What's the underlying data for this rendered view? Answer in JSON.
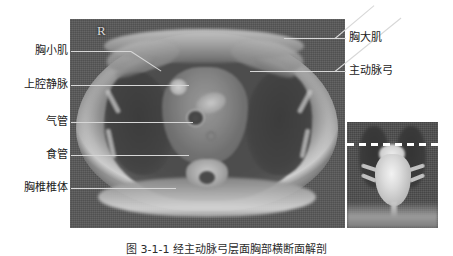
{
  "figure": {
    "orientation_marker": "R",
    "caption": "图 3-1-1  经主动脉弓层面胸部横断面解剖"
  },
  "labels_left": [
    {
      "text": "胸小肌",
      "top": 45,
      "lead_y": 51
    },
    {
      "text": "上腔静脉",
      "top": 79,
      "lead_y": 85
    },
    {
      "text": "气管",
      "top": 116,
      "lead_y": 122
    },
    {
      "text": "食管",
      "top": 149,
      "lead_y": 155
    },
    {
      "text": "胸椎椎体",
      "top": 182,
      "lead_y": 188
    }
  ],
  "labels_right": [
    {
      "text": "胸大肌",
      "top": 32,
      "lead_y": 38
    },
    {
      "text": "主动脉弓",
      "top": 65,
      "lead_y": 71
    }
  ],
  "main_image": {
    "name": "axial-chest-scan",
    "modality_tone": "grayscale"
  },
  "inset_image": {
    "name": "coronal-heart-scan",
    "localizer": "dashed-line"
  },
  "colors": {
    "page_background": "#ffffff",
    "scan_background": "#585858",
    "leader_line": "#d7d7d7",
    "label_text": "#1a1a1a",
    "marker_text": "#d8d8d8",
    "dash_line": "#ffffff"
  }
}
